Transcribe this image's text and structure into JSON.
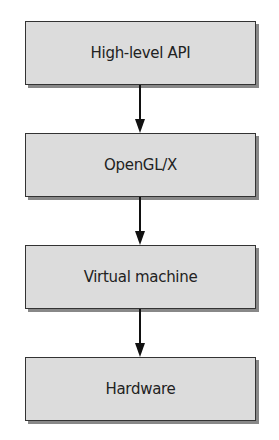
{
  "diagram": {
    "type": "layer-stack",
    "layers": [
      {
        "label": "High-level API"
      },
      {
        "label": "OpenGL/X"
      },
      {
        "label": "Virtual machine"
      },
      {
        "label": "Hardware"
      }
    ],
    "edges": [
      {
        "from": "High-level API",
        "to": "OpenGL/X"
      },
      {
        "from": "OpenGL/X",
        "to": "Virtual machine"
      },
      {
        "from": "Virtual machine",
        "to": "Hardware"
      }
    ],
    "colors": {
      "box_fill": "#dcdcdc",
      "border": "#333333",
      "shadow": "#888888",
      "arrow": "#111111"
    }
  }
}
